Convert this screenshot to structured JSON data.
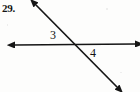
{
  "figure": {
    "problem_number": "29.",
    "background_color": "#fdfdfc",
    "stroke_color": "#151515",
    "labels": {
      "angle_3": "3",
      "angle_4": "4"
    }
  },
  "chart_data": {
    "type": "diagram",
    "title": "",
    "canvas": {
      "width": 140,
      "height": 92
    },
    "intersection_point": {
      "x": 77,
      "y": 45
    },
    "lines": [
      {
        "name": "horizontal-line",
        "arrowheads": "both",
        "from": {
          "x": 15,
          "y": 45
        },
        "to": {
          "x": 135,
          "y": 44
        }
      },
      {
        "name": "diagonal-line",
        "arrowheads": "both",
        "from": {
          "x": 36,
          "y": 5
        },
        "to": {
          "x": 117,
          "y": 87
        }
      }
    ],
    "annotations": [
      {
        "name": "angle-label-3",
        "text": "3",
        "x": 53,
        "y": 36,
        "position": "above-left of intersection"
      },
      {
        "name": "angle-label-4",
        "text": "4",
        "x": 93,
        "y": 54,
        "position": "below-right of intersection"
      },
      {
        "name": "problem-number",
        "text": "29.",
        "x": 3,
        "y": 11,
        "position": "top-left margin"
      }
    ]
  }
}
